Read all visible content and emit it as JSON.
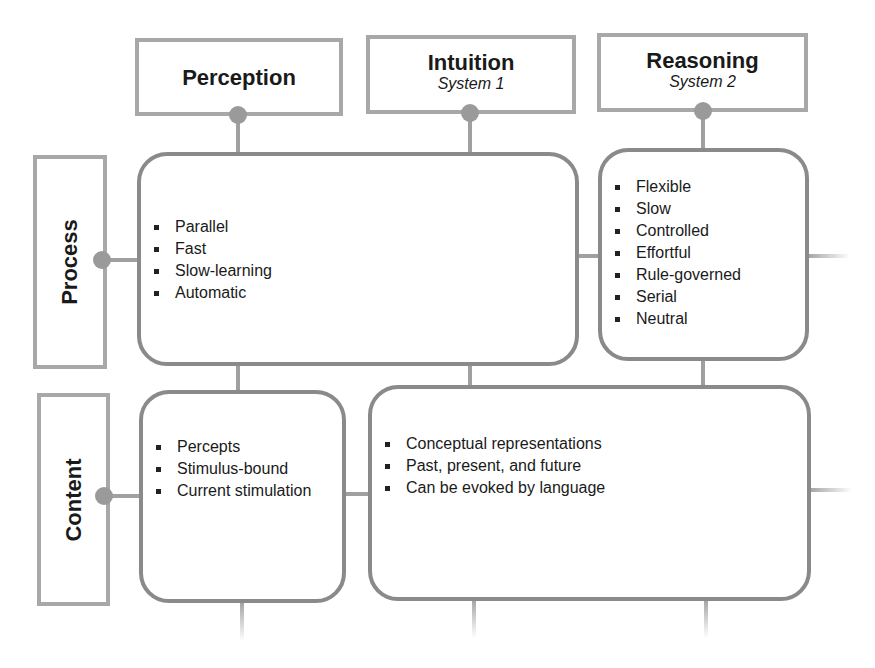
{
  "columns": [
    {
      "title": "Perception",
      "subtitle": ""
    },
    {
      "title": "Intuition",
      "subtitle": "System 1"
    },
    {
      "title": "Reasoning",
      "subtitle": "System 2"
    }
  ],
  "rows": [
    {
      "label": "Process"
    },
    {
      "label": "Content"
    }
  ],
  "cells": {
    "process_perception_intuition": [
      "Parallel",
      "Fast",
      "Slow-learning",
      "Automatic"
    ],
    "process_reasoning": [
      "Flexible",
      "Slow",
      "Controlled",
      "Effortful",
      "Rule-governed",
      "Serial",
      "Neutral"
    ],
    "content_perception": [
      "Percepts",
      "Stimulus-bound",
      "Current stimulation"
    ],
    "content_intuition_reasoning": [
      "Conceptual representations",
      "Past, present, and future",
      "Can be evoked by language"
    ]
  },
  "colors": {
    "box_border": "#a8a8a8",
    "cell_border": "#8a8a8a",
    "connector": "#a0a0a0",
    "dot": "#9a9a9a",
    "text": "#1a1a1a"
  }
}
